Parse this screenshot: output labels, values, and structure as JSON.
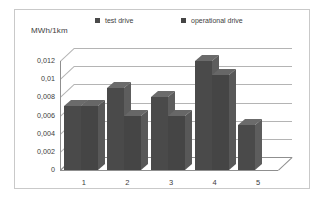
{
  "chart_data": {
    "type": "bar",
    "title": "",
    "subtitle": "",
    "xlabel": "",
    "ylabel": "MWh/1km",
    "categories": [
      "1",
      "2",
      "3",
      "4",
      "5"
    ],
    "series": [
      {
        "name": "test drive",
        "values": [
          0.007,
          0.009,
          0.008,
          0.012,
          0.005
        ]
      },
      {
        "name": "operational drive",
        "values": [
          0.007,
          0.006,
          0.006,
          0.0105,
          null
        ]
      }
    ],
    "ylim": [
      0,
      0.013
    ],
    "yticks": [
      0,
      0.002,
      0.004,
      0.006,
      0.008,
      0.01,
      0.012
    ],
    "ytick_labels": [
      "0",
      "0,002",
      "0,004",
      "0,006",
      "0,008",
      "0,01",
      "0,012"
    ],
    "grid": true,
    "legend_position": "top",
    "style": "3d-clustered-column",
    "colors": {
      "series_front": [
        "#4a4a4a",
        "#454545"
      ],
      "series_side": [
        "#5d5d5d",
        "#585858"
      ],
      "series_top": [
        "#6b6b6b",
        "#676767"
      ],
      "gridline": "#b4b4b4",
      "axis": "#8f8f8f",
      "frame": "#c9c9c9",
      "text": "#3d3d3d",
      "background": "#ffffff"
    }
  }
}
